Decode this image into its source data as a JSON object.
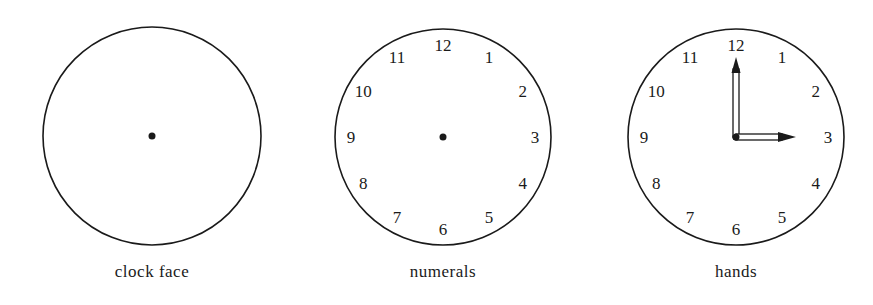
{
  "figures": [
    {
      "caption": "clock face",
      "cx": 152,
      "cy": 136,
      "r": 109,
      "show_numerals": false,
      "show_hands": false
    },
    {
      "caption": "numerals",
      "cx": 443,
      "cy": 137,
      "r": 108,
      "show_numerals": true,
      "show_hands": false
    },
    {
      "caption": "hands",
      "cx": 736,
      "cy": 137,
      "r": 108,
      "show_numerals": true,
      "show_hands": true
    }
  ],
  "numerals": [
    "12",
    "1",
    "2",
    "3",
    "4",
    "5",
    "6",
    "7",
    "8",
    "9",
    "10",
    "11"
  ],
  "hands": {
    "hour_points_to": "3",
    "minute_points_to": "12",
    "time_shown": "3:00"
  },
  "colors": {
    "stroke": "#1a1a1a",
    "background": "#ffffff"
  }
}
